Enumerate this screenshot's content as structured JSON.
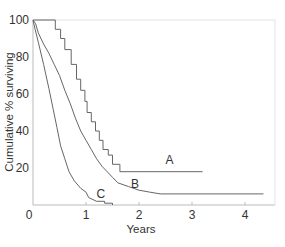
{
  "chart_data": {
    "type": "line",
    "subtype": "kaplan-meier step",
    "title": "",
    "xlabel": "Years",
    "ylabel": "Cumulative % surviving",
    "xlim": [
      0,
      4.55
    ],
    "ylim": [
      0,
      100
    ],
    "x_ticks": [
      0,
      1,
      2,
      3,
      4
    ],
    "y_ticks": [
      20,
      40,
      60,
      80,
      100
    ],
    "x_tick_labels": [
      "0",
      "1",
      "2",
      "3",
      "4"
    ],
    "y_tick_labels": [
      "20",
      "40",
      "60",
      "80",
      "100"
    ],
    "origin_label": "0",
    "grid": false,
    "legend": "inline labels",
    "series": [
      {
        "name": "A",
        "label_pos": [
          2.5,
          22
        ],
        "points": [
          [
            0,
            100
          ],
          [
            0.42,
            100
          ],
          [
            0.42,
            95
          ],
          [
            0.52,
            95
          ],
          [
            0.52,
            90
          ],
          [
            0.6,
            90
          ],
          [
            0.6,
            84
          ],
          [
            0.72,
            84
          ],
          [
            0.72,
            76
          ],
          [
            0.82,
            76
          ],
          [
            0.82,
            68
          ],
          [
            0.9,
            68
          ],
          [
            0.9,
            62
          ],
          [
            0.98,
            62
          ],
          [
            0.98,
            56
          ],
          [
            1.02,
            56
          ],
          [
            1.02,
            50
          ],
          [
            1.1,
            50
          ],
          [
            1.1,
            45
          ],
          [
            1.18,
            45
          ],
          [
            1.18,
            40
          ],
          [
            1.25,
            40
          ],
          [
            1.25,
            35
          ],
          [
            1.32,
            35
          ],
          [
            1.32,
            30
          ],
          [
            1.42,
            30
          ],
          [
            1.42,
            27
          ],
          [
            1.5,
            27
          ],
          [
            1.5,
            22
          ],
          [
            1.64,
            22
          ],
          [
            1.64,
            18
          ],
          [
            3.2,
            18
          ]
        ]
      },
      {
        "name": "B",
        "label_pos": [
          1.85,
          9
        ],
        "points": [
          [
            0,
            100
          ],
          [
            0.05,
            98
          ],
          [
            0.1,
            93
          ],
          [
            0.2,
            87
          ],
          [
            0.3,
            82
          ],
          [
            0.4,
            76
          ],
          [
            0.5,
            70
          ],
          [
            0.6,
            62
          ],
          [
            0.7,
            55
          ],
          [
            0.8,
            47
          ],
          [
            0.9,
            40
          ],
          [
            1.0,
            35
          ],
          [
            1.1,
            30
          ],
          [
            1.2,
            25
          ],
          [
            1.3,
            21
          ],
          [
            1.4,
            18
          ],
          [
            1.5,
            15
          ],
          [
            1.6,
            12
          ],
          [
            1.8,
            10
          ],
          [
            2.0,
            8
          ],
          [
            2.2,
            7
          ],
          [
            2.4,
            6
          ],
          [
            3.0,
            6
          ],
          [
            4.35,
            6
          ]
        ]
      },
      {
        "name": "C",
        "label_pos": [
          1.2,
          4
        ],
        "points": [
          [
            0,
            100
          ],
          [
            0.04,
            95
          ],
          [
            0.1,
            88
          ],
          [
            0.2,
            76
          ],
          [
            0.3,
            63
          ],
          [
            0.38,
            52
          ],
          [
            0.45,
            42
          ],
          [
            0.52,
            32
          ],
          [
            0.6,
            25
          ],
          [
            0.68,
            18
          ],
          [
            0.78,
            13
          ],
          [
            0.9,
            9
          ],
          [
            1.0,
            7
          ],
          [
            1.05,
            4
          ],
          [
            1.2,
            2
          ],
          [
            1.35,
            2
          ],
          [
            1.35,
            1
          ],
          [
            1.5,
            1
          ],
          [
            1.5,
            0
          ]
        ]
      }
    ]
  },
  "colors": {
    "line": "#666666",
    "axis": "#bbbbbb",
    "text": "#333333"
  }
}
